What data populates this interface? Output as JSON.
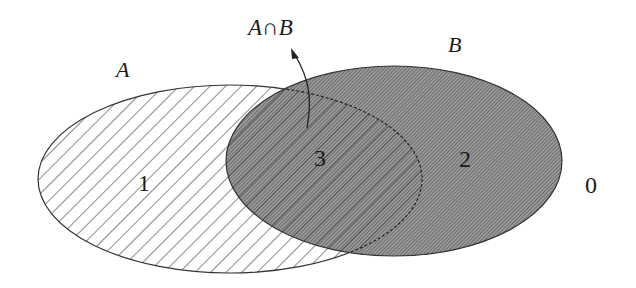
{
  "diagram": {
    "type": "venn",
    "sets": [
      {
        "name": "A",
        "label": "A",
        "fill": "diagonal-hatch-sparse"
      },
      {
        "name": "B",
        "label": "B",
        "fill": "dense-hatch-gray"
      }
    ],
    "intersection_label": "A∩B",
    "regions": [
      {
        "id": "only-A",
        "label": "1"
      },
      {
        "id": "only-B",
        "label": "2"
      },
      {
        "id": "A-and-B",
        "label": "3"
      },
      {
        "id": "outside",
        "label": "0"
      }
    ],
    "colors": {
      "outline": "#333333",
      "b_fill": "#8a8a8a",
      "hatch": "#2a2a2a",
      "background": "#ffffff"
    }
  }
}
